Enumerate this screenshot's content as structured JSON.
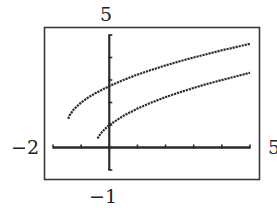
{
  "chart_data": {
    "type": "line",
    "title": "",
    "xlabel": "",
    "ylabel": "",
    "xlim": [
      -2,
      5
    ],
    "ylim": [
      -1,
      5
    ],
    "grid": false,
    "legend": null,
    "window_labels": {
      "ymax": "5",
      "ymin": "−1",
      "xmin": "−2",
      "xmax": "5"
    },
    "x_ticks": [
      -2,
      -1,
      0,
      1,
      2,
      3,
      4,
      5
    ],
    "y_ticks": [
      -1,
      0,
      1,
      2,
      3,
      4,
      5
    ],
    "series": [
      {
        "name": "upper curve",
        "x": [
          -1.46,
          -1.4,
          -1.25,
          -1,
          -0.75,
          -0.5,
          0,
          0.5,
          1,
          1.5,
          2,
          2.5,
          3,
          3.5,
          4,
          4.5,
          5
        ],
        "y": [
          1.28,
          1.45,
          1.71,
          2.0,
          2.22,
          2.41,
          2.73,
          3.0,
          3.24,
          3.45,
          3.65,
          3.83,
          4.0,
          4.16,
          4.32,
          4.46,
          4.61
        ]
      },
      {
        "name": "lower curve",
        "x": [
          -0.42,
          -0.3,
          -0.2,
          0,
          0.5,
          1,
          1.5,
          2,
          2.5,
          3,
          3.5,
          4,
          4.5,
          5
        ],
        "y": [
          0.4,
          0.63,
          0.77,
          1.0,
          1.41,
          1.73,
          2.0,
          2.24,
          2.45,
          2.65,
          2.83,
          3.0,
          3.16,
          3.32
        ]
      }
    ]
  },
  "colors": {
    "ink": "#2a2a2a",
    "frame": "#3a3a3a",
    "background": "#ffffff"
  }
}
